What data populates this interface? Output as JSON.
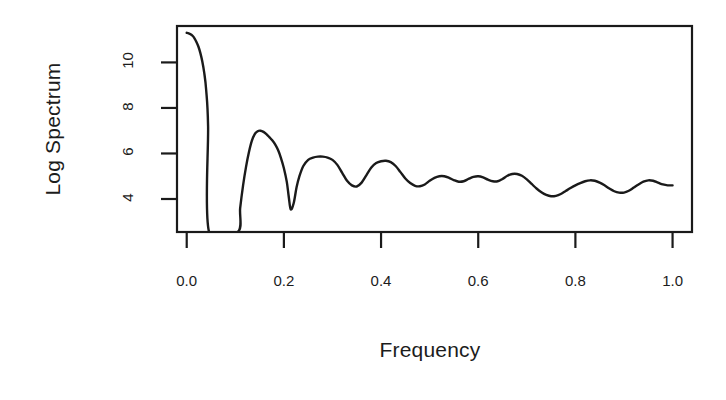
{
  "chart_data": {
    "type": "line",
    "title": "",
    "xlabel": "Frequency",
    "ylabel": "Log Spectrum",
    "xlim": [
      -0.02,
      1.04
    ],
    "ylim": [
      2.55,
      11.6
    ],
    "xticks": [
      0.0,
      0.2,
      0.4,
      0.6,
      0.8,
      1.0
    ],
    "xticklabels": [
      "0.0",
      "0.2",
      "0.4",
      "0.6",
      "0.8",
      "1.0"
    ],
    "yticks": [
      4,
      6,
      8,
      10
    ],
    "yticklabels": [
      "4",
      "6",
      "8",
      "10"
    ],
    "grid": false,
    "legend": null,
    "line_color": "#1a1a1a",
    "box_color": "#1a1a1a",
    "background": "#ffffff",
    "series": [
      {
        "name": "log spectrum",
        "note": "Main lobe descends off the bottom of the panel between ~0.045 and ~0.105; values there fall below the plotted y-range.",
        "x": [
          0.0,
          0.004,
          0.008,
          0.012,
          0.016,
          0.02,
          0.024,
          0.028,
          0.032,
          0.036,
          0.04,
          0.044,
          0.046,
          0.105,
          0.11,
          0.116,
          0.122,
          0.128,
          0.134,
          0.14,
          0.146,
          0.152,
          0.158,
          0.164,
          0.17,
          0.176,
          0.182,
          0.188,
          0.194,
          0.2,
          0.206,
          0.21,
          0.214,
          0.22,
          0.226,
          0.232,
          0.24,
          0.25,
          0.26,
          0.27,
          0.28,
          0.29,
          0.3,
          0.31,
          0.32,
          0.33,
          0.34,
          0.35,
          0.36,
          0.37,
          0.38,
          0.39,
          0.4,
          0.41,
          0.42,
          0.43,
          0.44,
          0.45,
          0.46,
          0.47,
          0.48,
          0.49,
          0.5,
          0.51,
          0.52,
          0.53,
          0.54,
          0.55,
          0.56,
          0.57,
          0.58,
          0.59,
          0.6,
          0.61,
          0.62,
          0.63,
          0.64,
          0.65,
          0.66,
          0.67,
          0.68,
          0.69,
          0.7,
          0.71,
          0.72,
          0.73,
          0.74,
          0.75,
          0.76,
          0.77,
          0.78,
          0.79,
          0.8,
          0.81,
          0.82,
          0.83,
          0.84,
          0.85,
          0.86,
          0.87,
          0.88,
          0.89,
          0.9,
          0.91,
          0.92,
          0.93,
          0.94,
          0.95,
          0.96,
          0.97,
          0.98,
          0.99,
          1.0
        ],
        "y": [
          11.3,
          11.28,
          11.24,
          11.17,
          11.06,
          10.9,
          10.7,
          10.42,
          10.05,
          9.55,
          8.8,
          7.2,
          2.55,
          2.55,
          3.6,
          4.6,
          5.4,
          6.05,
          6.55,
          6.85,
          6.98,
          7.0,
          6.95,
          6.85,
          6.72,
          6.58,
          6.4,
          6.15,
          5.8,
          5.35,
          4.75,
          4.1,
          3.55,
          3.8,
          4.5,
          5.0,
          5.45,
          5.72,
          5.82,
          5.86,
          5.86,
          5.82,
          5.72,
          5.5,
          5.15,
          4.8,
          4.6,
          4.55,
          4.72,
          5.05,
          5.38,
          5.58,
          5.66,
          5.68,
          5.62,
          5.45,
          5.18,
          4.9,
          4.7,
          4.58,
          4.56,
          4.64,
          4.8,
          4.93,
          5.0,
          5.0,
          4.93,
          4.83,
          4.76,
          4.78,
          4.88,
          4.97,
          5.0,
          4.95,
          4.85,
          4.78,
          4.78,
          4.88,
          5.02,
          5.1,
          5.1,
          5.02,
          4.86,
          4.66,
          4.46,
          4.3,
          4.18,
          4.12,
          4.14,
          4.22,
          4.35,
          4.48,
          4.6,
          4.7,
          4.78,
          4.82,
          4.8,
          4.72,
          4.6,
          4.46,
          4.34,
          4.28,
          4.28,
          4.36,
          4.5,
          4.64,
          4.76,
          4.82,
          4.8,
          4.72,
          4.64,
          4.6,
          4.6
        ]
      }
    ]
  },
  "axes": {
    "ylabel": "Log Spectrum",
    "xlabel": "Frequency"
  }
}
